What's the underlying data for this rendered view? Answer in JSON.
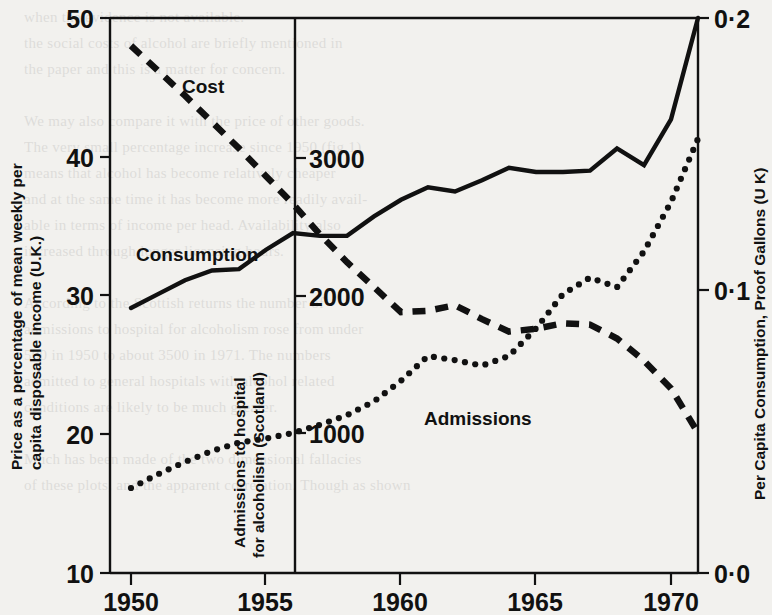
{
  "figure": {
    "background_color": "#f2f1ee",
    "ink_color": "#111111"
  },
  "ghost_text": "when the evidence is not available.\nthe social costs of alcohol are briefly mentioned in\nthe paper and this is a matter for concern.\n\nWe may also compare it with the price of other goods.\nThe very small percentage increase since 1950 (fig 1)\nmeans that alcohol has become relatively cheaper\nand at the same time it has become more readily avail-\nable in terms of income per head. Availability also\nincreased through longer licensing hours.\n\nAccording to the Scottish returns the number of\nadmissions to hospital for alcoholism rose from under\n500 in 1950 to about 3500 in 1971. The numbers\nadmitted to general hospitals with alcohol related\nconditions are likely to be much greater.\n\nMuch has been made of the two dimensional fallacies\nof these plots, and the apparent correlation. Though as shown",
  "labels": {
    "y_axis_left_line1": "Price as a percentage of mean weekly per",
    "y_axis_left_line2": "capita disposable income (U.K.)",
    "y_axis_right_title": "Per Capita Consumption, Proof Gallons (U K)",
    "y_axis_inner_line1": "Admissions to hospital",
    "y_axis_inner_line2": "for alcoholism (Scotland)"
  },
  "series_labels": {
    "cost": "Cost",
    "consumption": "Consumption",
    "admissions": "Admissions"
  },
  "axes": {
    "x_ticks": [
      "1950",
      "1955",
      "1960",
      "1965",
      "1970"
    ],
    "y_left_ticks": [
      "50",
      "40",
      "30",
      "20",
      "10"
    ],
    "y_right_ticks": [
      "0·2",
      "0·1",
      "0·0"
    ],
    "y_inner_ticks": [
      "3000",
      "2000",
      "1000"
    ]
  },
  "chart_data": {
    "type": "line",
    "title": "",
    "xlabel": "",
    "ylabel": "Price as a percentage of mean weekly per capita disposable income (U.K.)",
    "ylabel_right": "Per Capita Consumption, Proof Gallons (U K)",
    "ylabel_inner": "Admissions to hospital for alcoholism (Scotland)",
    "xlim": [
      1950,
      1971.5
    ],
    "x_ticks": [
      1950,
      1955,
      1960,
      1965,
      1970
    ],
    "grid": false,
    "legend": "inline-annotations",
    "axis_left": {
      "label": "Price as a percentage of mean weekly per capita disposable income (U.K.)",
      "lim": [
        10,
        50
      ],
      "ticks": [
        10,
        20,
        30,
        40,
        50
      ]
    },
    "axis_right": {
      "label": "Per Capita Consumption, Proof Gallons (U K)",
      "lim": [
        0.0,
        0.2
      ],
      "ticks": [
        0.0,
        0.1,
        0.2
      ]
    },
    "axis_inner": {
      "label": "Admissions to hospital for alcoholism (Scotland)",
      "ticks": [
        1000,
        2000,
        3000
      ],
      "x_position_year": 1956.2
    },
    "series": [
      {
        "name": "Cost",
        "axis": "left",
        "style": "dashed",
        "x": [
          1950,
          1951,
          1952,
          1953,
          1954,
          1955,
          1956,
          1957,
          1958,
          1959,
          1960,
          1961,
          1962,
          1963,
          1964,
          1965,
          1966,
          1967,
          1968,
          1969,
          1970,
          1971
        ],
        "values": [
          48.0,
          46.2,
          44.4,
          42.5,
          40.6,
          38.6,
          36.6,
          34.4,
          32.4,
          30.6,
          28.8,
          28.9,
          29.3,
          28.3,
          27.4,
          27.6,
          28.0,
          27.9,
          26.9,
          25.3,
          23.3,
          20.1
        ]
      },
      {
        "name": "Consumption",
        "axis": "right",
        "style": "solid",
        "x": [
          1950,
          1951,
          1952,
          1953,
          1954,
          1955,
          1956,
          1957,
          1958,
          1959,
          1960,
          1961,
          1962,
          1963,
          1964,
          1965,
          1966,
          1967,
          1968,
          1969,
          1970,
          1971
        ],
        "values": [
          0.0955,
          0.1005,
          0.1055,
          0.109,
          0.1095,
          0.1165,
          0.1225,
          0.1215,
          0.1215,
          0.1285,
          0.1345,
          0.139,
          0.1375,
          0.1415,
          0.146,
          0.1445,
          0.1445,
          0.145,
          0.153,
          0.147,
          0.1635,
          0.2
        ]
      },
      {
        "name": "Admissions",
        "axis": "inner",
        "style": "dotted",
        "x": [
          1950,
          1951,
          1952,
          1953,
          1954,
          1955,
          1956,
          1957,
          1958,
          1959,
          1960,
          1961,
          1962,
          1963,
          1964,
          1965,
          1966,
          1967,
          1968,
          1969,
          1970,
          1971
        ],
        "values": [
          600,
          700,
          790,
          870,
          930,
          960,
          1000,
          1060,
          1130,
          1230,
          1380,
          1560,
          1530,
          1490,
          1560,
          1760,
          2010,
          2130,
          2060,
          2320,
          2680,
          3140
        ]
      }
    ]
  }
}
